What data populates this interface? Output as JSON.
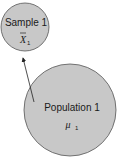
{
  "diagram": {
    "sample": {
      "label": "Sample 1",
      "symbol": "X",
      "subscript": "1",
      "fill": "#c8c8c8"
    },
    "population": {
      "label": "Population 1",
      "symbol": "μ",
      "subscript": "1",
      "fill": "#c8c8c8"
    },
    "arrow": {
      "from": "population",
      "to": "sample"
    }
  }
}
